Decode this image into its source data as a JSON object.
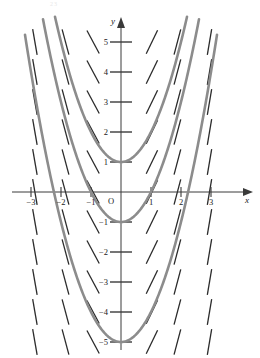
{
  "figure": {
    "title": "",
    "corner_note": "23"
  },
  "axes": {
    "x_axis_label": "x",
    "y_axis_label": "y",
    "origin_label": "O",
    "x_ticks": [
      {
        "value": -3,
        "label": "−3"
      },
      {
        "value": -2,
        "label": "−2"
      },
      {
        "value": -1,
        "label": "−1"
      },
      {
        "value": 1,
        "label": "1"
      },
      {
        "value": 2,
        "label": "2"
      },
      {
        "value": 3,
        "label": "3"
      }
    ],
    "y_ticks": [
      {
        "value": 5,
        "label": "5"
      },
      {
        "value": 4,
        "label": "4"
      },
      {
        "value": 3,
        "label": "3"
      },
      {
        "value": 2,
        "label": "2"
      },
      {
        "value": 1,
        "label": "1"
      },
      {
        "value": -1,
        "label": "−1"
      },
      {
        "value": -2,
        "label": "−2"
      },
      {
        "value": -3,
        "label": "−3"
      },
      {
        "value": -4,
        "label": "−4"
      },
      {
        "value": -5,
        "label": "−5"
      }
    ]
  },
  "chart_data": {
    "type": "line",
    "title": "",
    "xlabel": "x",
    "ylabel": "y",
    "xlim": [
      -4.0,
      4.6
    ],
    "ylim": [
      -5.85,
      5.85
    ],
    "grid": false,
    "legend": "none",
    "slope_field": {
      "equation": "dy/dx = 2x",
      "stroke_color": "#2b2b2b",
      "segment_length": 26,
      "x_positions": [
        -2.87,
        -1.85,
        -0.93,
        1.03,
        1.88,
        2.95
      ],
      "y_positions": [
        5.0,
        4.0,
        3.0,
        2.0,
        1.0,
        0.0,
        -1.0,
        -2.0,
        -3.0,
        -4.0,
        -5.0
      ],
      "slope_rule_multiplier": 2
    },
    "series": [
      {
        "name": "y = x² + 1",
        "vertex": [
          0,
          1
        ],
        "constant": 1,
        "color": "#8c8c8c",
        "x": [
          -2.2,
          -1.8,
          -1.4,
          -1.0,
          -0.6,
          -0.2,
          0.2,
          0.6,
          1.0,
          1.4,
          1.8,
          2.2
        ],
        "values": [
          5.84,
          4.24,
          2.96,
          2.0,
          1.36,
          1.04,
          1.04,
          1.36,
          2.0,
          2.96,
          4.24,
          5.84
        ]
      },
      {
        "name": "y = x² − 1",
        "vertex": [
          0,
          -1
        ],
        "constant": -1,
        "color": "#8c8c8c",
        "x": [
          -2.6,
          -2.2,
          -1.8,
          -1.4,
          -1.0,
          -0.6,
          -0.2,
          0.2,
          0.6,
          1.0,
          1.4,
          1.8,
          2.2,
          2.6
        ],
        "values": [
          5.76,
          3.84,
          2.24,
          0.96,
          0.0,
          -0.64,
          -0.96,
          -0.96,
          -0.64,
          0.0,
          0.96,
          2.24,
          3.84,
          5.76
        ]
      },
      {
        "name": "y = x² − 5",
        "vertex": [
          0,
          -5
        ],
        "constant": -5,
        "color": "#8c8c8c",
        "x": [
          -2.0,
          -1.6,
          -1.2,
          -0.8,
          -0.4,
          0.0,
          0.4,
          0.8,
          1.2,
          1.6,
          2.0
        ],
        "values": [
          -1.0,
          -2.44,
          -3.56,
          -4.36,
          -4.84,
          -5.0,
          -4.84,
          -4.36,
          -3.56,
          -2.44,
          -1.0
        ]
      }
    ]
  }
}
